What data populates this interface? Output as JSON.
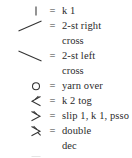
{
  "legend": {
    "title": "Knitting chart symbol key",
    "equals_sign": "=",
    "entries": [
      {
        "symbol_name": "vertical-bar-symbol",
        "symbol_glyph": "vertical-bar",
        "description": "k 1",
        "description_cont": ""
      },
      {
        "symbol_name": "diagonal-up-right-symbol",
        "symbol_glyph": "diagonal-up-right",
        "description": "2-st right",
        "description_cont": "cross"
      },
      {
        "symbol_name": "diagonal-down-right-symbol",
        "symbol_glyph": "diagonal-down-right",
        "description": "2-st left",
        "description_cont": "cross"
      },
      {
        "symbol_name": "circle-symbol",
        "symbol_glyph": "circle",
        "description": "yarn over",
        "description_cont": ""
      },
      {
        "symbol_name": "left-chevron-stem-symbol",
        "symbol_glyph": "left-chevron-stem",
        "description": "k 2 tog",
        "description_cont": ""
      },
      {
        "symbol_name": "right-chevron-stem-symbol",
        "symbol_glyph": "right-chevron-stem",
        "description": "slip 1, k 1, psso",
        "description_cont": ""
      },
      {
        "symbol_name": "double-chevron-stem-symbol",
        "symbol_glyph": "double-chevron-stem",
        "description": "double",
        "description_cont": "dec"
      },
      {
        "symbol_name": "square-symbol",
        "symbol_glyph": "square",
        "description": "p 1",
        "description_cont": ""
      }
    ]
  },
  "colors": {
    "background": "#ffffff",
    "text": "#2b2b2b",
    "stroke": "#333333"
  }
}
